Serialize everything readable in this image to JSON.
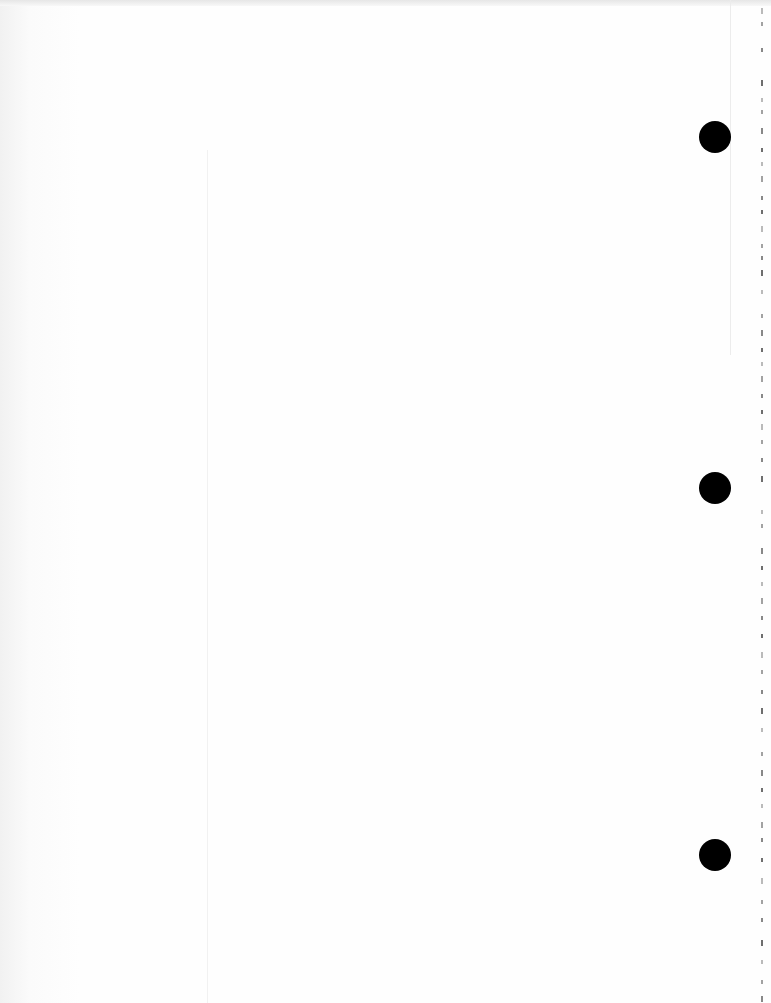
{
  "page": {
    "type": "scanned notebook page",
    "text_content": "",
    "background_color": "#fdfdfd",
    "margin_line_color": "#f1f1f1"
  },
  "punch_holes": [
    {
      "name": "hole-top",
      "x": 715,
      "y": 137
    },
    {
      "name": "hole-middle",
      "x": 715,
      "y": 488
    },
    {
      "name": "hole-bottom",
      "x": 715,
      "y": 855
    }
  ],
  "edge_ticks": [
    8,
    22,
    48,
    80,
    98,
    110,
    128,
    148,
    162,
    176,
    196,
    210,
    226,
    244,
    256,
    270,
    290,
    314,
    330,
    348,
    362,
    376,
    394,
    410,
    424,
    440,
    458,
    476,
    510,
    524,
    548,
    566,
    582,
    598,
    616,
    634,
    652,
    670,
    690,
    708,
    728,
    752,
    770,
    788,
    804,
    822,
    838,
    858,
    878,
    900,
    918,
    940,
    960,
    980,
    996
  ]
}
